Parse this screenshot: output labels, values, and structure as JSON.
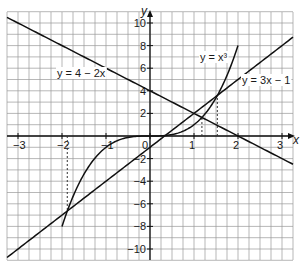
{
  "chart_data": {
    "type": "line",
    "title": "",
    "xlabel": "x",
    "ylabel": "y",
    "xlim": [
      -3.25,
      3.25
    ],
    "ylim": [
      -11,
      11
    ],
    "grid": true,
    "grid_step": {
      "x": 0.25,
      "y": 1
    },
    "x_ticks": [
      -3,
      -2,
      -1,
      0,
      1,
      2,
      3
    ],
    "x_tick_labels": [
      "−3",
      "−2",
      "−1",
      "0",
      "1",
      "2",
      "3"
    ],
    "y_ticks": [
      -10,
      -8,
      -6,
      -4,
      -2,
      2,
      4,
      6,
      8,
      10
    ],
    "y_tick_labels": [
      "−10",
      "−8",
      "−6",
      "−4",
      "−2",
      "2",
      "4",
      "6",
      "8",
      "10"
    ],
    "series": [
      {
        "name": "y = 4 − 2x",
        "expr": "4-2x",
        "x_range": [
          -3.25,
          3.25
        ],
        "label": {
          "x": -2.0,
          "y": 5.7
        }
      },
      {
        "name": "y = 3x − 1",
        "expr": "3x-1",
        "x_range": [
          -3.25,
          3.25
        ],
        "label": {
          "x": 2.1,
          "y": 5.0
        }
      },
      {
        "name": "y = x³",
        "expr": "x^3",
        "x_range": [
          -2,
          2
        ],
        "label": {
          "x": 1.15,
          "y": 7.0
        }
      }
    ],
    "annotations": [
      {
        "type": "dashed-vertical",
        "x": -1.88,
        "y_from": 0,
        "y_to": -6.64,
        "note": "intersection of y=x³ and y=3x−1"
      },
      {
        "type": "dashed-vertical",
        "x": 1.18,
        "y_from": 0,
        "y_to": 1.64,
        "note": "intersection of y=x³ and y=4−2x"
      },
      {
        "type": "dashed-vertical",
        "x": 1.53,
        "y_from": 0,
        "y_to": 3.6,
        "note": "intersection of y=x³ and y=3x−1"
      }
    ]
  },
  "labels": {
    "x_axis": "x",
    "y_axis": "y",
    "eq_linear_down": "y = 4 − 2x",
    "eq_linear_up": "y = 3x − 1",
    "eq_cubic": "y = x³"
  }
}
